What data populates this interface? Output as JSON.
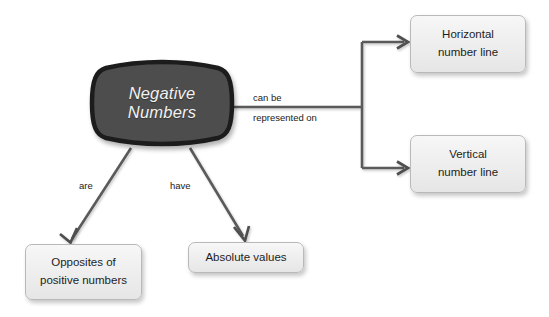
{
  "diagram": {
    "type": "concept-map",
    "title": "Negative Numbers",
    "background_color": "#ffffff",
    "center_node": {
      "label_line1": "Negative",
      "label_line2": "Numbers",
      "fill_color": "#4d4d4d",
      "border_color": "#1c1c1c",
      "text_color": "#f2f2f2"
    },
    "nodes": [
      {
        "id": "horizontal-number-line",
        "line1": "Horizontal",
        "line2": "number line",
        "fill_color": "#efefef",
        "border_color": "#b9b9b9"
      },
      {
        "id": "vertical-number-line",
        "line1": "Vertical",
        "line2": "number line",
        "fill_color": "#efefef",
        "border_color": "#b9b9b9"
      },
      {
        "id": "opposites-of-positive-numbers",
        "line1": "Opposites of",
        "line2": "positive numbers",
        "fill_color": "#efefef",
        "border_color": "#b9b9b9"
      },
      {
        "id": "absolute-values",
        "line1": "Absolute values",
        "line2": "",
        "fill_color": "#efefef",
        "border_color": "#b9b9b9"
      }
    ],
    "edge_labels": {
      "can_be": "can be",
      "represented_on": "represented on",
      "are": "are",
      "have": "have"
    },
    "connector_color": "#5a5a5a"
  }
}
